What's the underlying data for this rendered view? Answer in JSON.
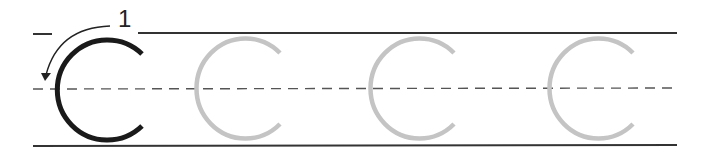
{
  "worksheet": {
    "letter": "C",
    "stroke_number": "1",
    "model_letter_color": "#1a1a1a",
    "trace_letter_color": "#c4c4c4",
    "guide_line_color": "#333333",
    "midline_color": "#555555",
    "trace_count": 3,
    "letters": [
      {
        "type": "model",
        "cx": 100
      },
      {
        "type": "trace",
        "cx": 239
      },
      {
        "type": "trace",
        "cx": 412
      },
      {
        "type": "trace",
        "cx": 586
      }
    ]
  }
}
